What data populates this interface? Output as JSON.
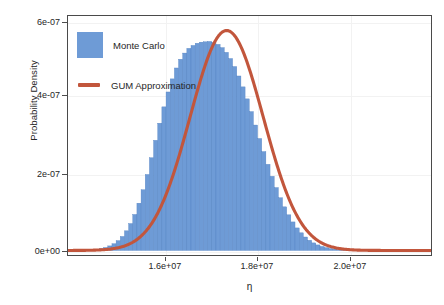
{
  "chart_data": {
    "type": "bar",
    "title": "",
    "xlabel": "η",
    "ylabel": "Probability Density",
    "xlim": [
      14620000,
      21200000
    ],
    "ylim": [
      -1.8e-08,
      6.45e-07
    ],
    "grid": true,
    "legend_position": "top-left",
    "xticks": [
      16000000,
      18000000,
      20000000
    ],
    "xticklabels": [
      "1.6e+07",
      "1.8e+07",
      "2.0e+07"
    ],
    "yticks": [
      0,
      2e-07,
      4e-07,
      6e-07
    ],
    "yticklabels": [
      "0e+00",
      "2e-07",
      "4e-07",
      "6e-07"
    ],
    "series": [
      {
        "name": "Monte Carlo",
        "type": "histogram",
        "color": "#6e9bd6",
        "bin_width": 75000,
        "bin_centers": [
          14700000,
          14775000,
          14850000,
          14925000,
          15000000,
          15075000,
          15150000,
          15225000,
          15300000,
          15375000,
          15450000,
          15525000,
          15600000,
          15675000,
          15750000,
          15825000,
          15900000,
          15975000,
          16050000,
          16125000,
          16200000,
          16275000,
          16350000,
          16425000,
          16500000,
          16575000,
          16650000,
          16725000,
          16800000,
          16875000,
          16950000,
          17025000,
          17100000,
          17175000,
          17250000,
          17325000,
          17400000,
          17475000,
          17550000,
          17625000,
          17700000,
          17775000,
          17850000,
          17925000,
          18000000,
          18075000,
          18150000,
          18225000,
          18300000,
          18375000,
          18450000,
          18525000,
          18600000,
          18675000,
          18750000,
          18825000,
          18900000,
          18975000,
          19050000,
          19125000,
          19200000,
          19275000,
          19350000,
          19425000,
          19500000,
          19575000,
          19650000,
          19725000,
          19800000,
          19875000,
          19950000,
          20025000,
          20100000,
          20175000,
          20250000,
          20325000
        ],
        "densities": [
          2e-10,
          3e-10,
          5e-10,
          8e-10,
          1.3e-09,
          2.1e-09,
          3.4e-09,
          5.3e-09,
          8.2e-09,
          1.25e-08,
          1.85e-08,
          2.7e-08,
          3.85e-08,
          5.4e-08,
          7.4e-08,
          9.9e-08,
          1.3e-07,
          1.67e-07,
          2.09e-07,
          2.55e-07,
          3.03e-07,
          3.5e-07,
          3.95e-07,
          4.36e-07,
          4.72e-07,
          5.02e-07,
          5.26e-07,
          5.43e-07,
          5.56e-07,
          5.64e-07,
          5.7e-07,
          5.73e-07,
          5.74e-07,
          5.75e-07,
          5.72e-07,
          5.67e-07,
          5.58e-07,
          5.45e-07,
          5.28e-07,
          5.06e-07,
          4.8e-07,
          4.5e-07,
          4.17e-07,
          3.82e-07,
          3.45e-07,
          3.08e-07,
          2.72e-07,
          2.37e-07,
          2.04e-07,
          1.73e-07,
          1.45e-07,
          1.2e-07,
          9.8e-08,
          7.85e-08,
          6.2e-08,
          4.85e-08,
          3.7e-08,
          2.8e-08,
          2.08e-08,
          1.52e-08,
          1.1e-08,
          7.8e-09,
          5.4e-09,
          3.7e-09,
          2.5e-09,
          1.65e-09,
          1.1e-09,
          7e-10,
          4.5e-10,
          2.8e-10,
          1.8e-10,
          1.1e-10,
          7e-11,
          4e-11,
          2.5e-11,
          1.5e-11
        ]
      },
      {
        "name": "GUM Approximation",
        "type": "line",
        "color": "#c2563c",
        "distribution": "normal",
        "mean": 17480000,
        "sigma": 660000,
        "peak_density": 6.05e-07
      }
    ]
  },
  "legend": {
    "items": [
      {
        "label": "Monte Carlo",
        "marker": "filled-square",
        "color": "#6e9bd6"
      },
      {
        "label": "GUM Approximation",
        "marker": "line",
        "color": "#c2563c"
      }
    ]
  },
  "axes": {
    "x_title": "η",
    "y_title": "Probability Density",
    "x_tick_labels": [
      "1.6e+07",
      "1.8e+07",
      "2.0e+07"
    ],
    "y_tick_labels": [
      "0e+00",
      "2e-07",
      "4e-07",
      "6e-07"
    ]
  },
  "colors": {
    "histogram": "#6e9bd6",
    "curve": "#c2563c",
    "frame": "#4a4a4a",
    "grid": "#f2f2f2",
    "text": "#262626",
    "background": "#ffffff"
  }
}
